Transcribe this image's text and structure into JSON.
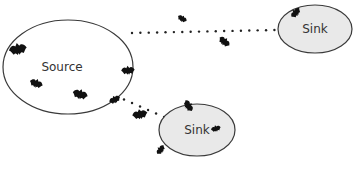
{
  "diagram": {
    "type": "source-sink population diagram",
    "colors": {
      "background": "#ffffff",
      "outline": "#3a3a3a",
      "source_fill": "#ffffff",
      "sink_fill": "#e9e9e9",
      "bat": "#111111",
      "dots": "#222222",
      "label": "#333333"
    },
    "nodes": [
      {
        "id": "source",
        "label": "Source",
        "cx": 68,
        "cy": 67,
        "rx": 65,
        "ry": 47,
        "fill": "source"
      },
      {
        "id": "sink-top",
        "label": "Sink",
        "cx": 315,
        "cy": 29,
        "rx": 37,
        "ry": 24,
        "fill": "sink"
      },
      {
        "id": "sink-bottom",
        "label": "Sink",
        "cx": 197,
        "cy": 130,
        "rx": 38,
        "ry": 26,
        "fill": "sink"
      }
    ],
    "edges": [
      {
        "from": "source",
        "to": "sink-top",
        "style": "dotted"
      },
      {
        "from": "source",
        "to": "sink-bottom",
        "style": "dotted"
      }
    ],
    "bats": [
      {
        "x": 18,
        "y": 50,
        "scale": 1.0,
        "rot": -10
      },
      {
        "x": 36,
        "y": 84,
        "scale": 0.75,
        "rot": 20
      },
      {
        "x": 80,
        "y": 95,
        "scale": 0.85,
        "rot": 15
      },
      {
        "x": 128,
        "y": 71,
        "scale": 0.75,
        "rot": -5
      },
      {
        "x": 115,
        "y": 100,
        "scale": 0.65,
        "rot": -25
      },
      {
        "x": 140,
        "y": 115,
        "scale": 0.85,
        "rot": -10
      },
      {
        "x": 182,
        "y": 19,
        "scale": 0.55,
        "rot": 30
      },
      {
        "x": 224,
        "y": 42,
        "scale": 0.7,
        "rot": 40
      },
      {
        "x": 296,
        "y": 13,
        "scale": 0.65,
        "rot": -50
      },
      {
        "x": 188,
        "y": 106,
        "scale": 0.7,
        "rot": 60
      },
      {
        "x": 216,
        "y": 129,
        "scale": 0.55,
        "rot": -15
      },
      {
        "x": 161,
        "y": 150,
        "scale": 0.6,
        "rot": -55
      }
    ]
  }
}
